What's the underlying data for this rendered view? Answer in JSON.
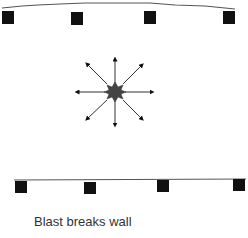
{
  "caption": "Blast breaks wall",
  "colors": {
    "wall_line": "#555555",
    "post": "#111111",
    "blast_core": "#444444",
    "arrow": "#111111",
    "caption_text": "#333333"
  },
  "top_wall": {
    "shape": "curved-bent-outward",
    "posts": 4
  },
  "bottom_wall": {
    "shape": "straight",
    "posts": 4
  },
  "blast": {
    "icon": "explosion-icon",
    "arrows": 8,
    "directions": [
      "up",
      "up-right",
      "right",
      "down-right",
      "down",
      "down-left",
      "left",
      "up-left"
    ]
  }
}
